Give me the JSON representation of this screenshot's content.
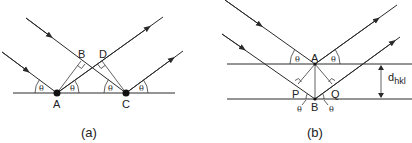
{
  "panels": [
    {
      "id": "a",
      "caption": "(a)",
      "points": {
        "A": "A",
        "B": "B",
        "C": "C",
        "D": "D"
      },
      "angle_symbol": "θ"
    },
    {
      "id": "b",
      "caption": "(b)",
      "points": {
        "A": "A",
        "B": "B",
        "P": "P",
        "Q": "Q"
      },
      "angle_symbol": "θ",
      "spacing_label": {
        "main": "d",
        "sub": "hkl"
      }
    }
  ],
  "colors": {
    "line": "#2a2a2a",
    "background": "#ffffff"
  }
}
